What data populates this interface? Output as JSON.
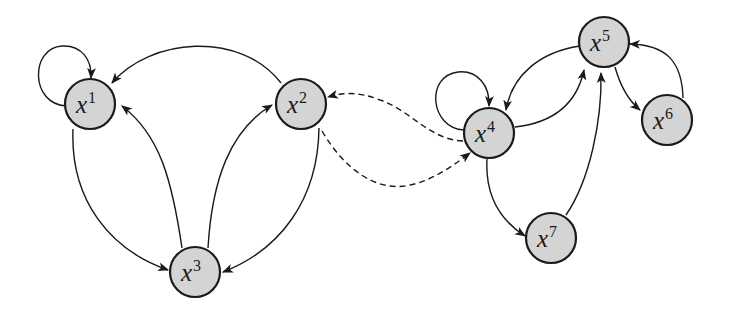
{
  "diagram": {
    "type": "directed-graph",
    "style": {
      "node_fill": "#d4d4d4",
      "node_stroke": "#1a1a1a",
      "edge_color": "#1a1a1a",
      "background": "#ffffff"
    },
    "nodes": [
      {
        "id": "x1",
        "base": "x",
        "sup": "1",
        "cx": 90,
        "cy": 104,
        "r": 25
      },
      {
        "id": "x2",
        "base": "x",
        "sup": "2",
        "cx": 301,
        "cy": 104,
        "r": 25
      },
      {
        "id": "x3",
        "base": "x",
        "sup": "3",
        "cx": 195,
        "cy": 272,
        "r": 25
      },
      {
        "id": "x4",
        "base": "x",
        "sup": "4",
        "cx": 489,
        "cy": 133,
        "r": 25
      },
      {
        "id": "x5",
        "base": "x",
        "sup": "5",
        "cx": 604,
        "cy": 42,
        "r": 25
      },
      {
        "id": "x6",
        "base": "x",
        "sup": "6",
        "cx": 667,
        "cy": 120,
        "r": 25
      },
      {
        "id": "x7",
        "base": "x",
        "sup": "7",
        "cx": 551,
        "cy": 238,
        "r": 25
      }
    ],
    "edges": [
      {
        "from": "x1",
        "to": "x1",
        "style": "solid",
        "kind": "self-loop"
      },
      {
        "from": "x2",
        "to": "x1",
        "style": "solid"
      },
      {
        "from": "x1",
        "to": "x3",
        "style": "solid"
      },
      {
        "from": "x3",
        "to": "x1",
        "style": "solid"
      },
      {
        "from": "x3",
        "to": "x2",
        "style": "solid"
      },
      {
        "from": "x2",
        "to": "x3",
        "style": "solid"
      },
      {
        "from": "x4",
        "to": "x2",
        "style": "dashed"
      },
      {
        "from": "x2",
        "to": "x4",
        "style": "dashed"
      },
      {
        "from": "x4",
        "to": "x4",
        "style": "solid",
        "kind": "self-loop"
      },
      {
        "from": "x5",
        "to": "x4",
        "style": "solid"
      },
      {
        "from": "x4",
        "to": "x5",
        "style": "solid"
      },
      {
        "from": "x4",
        "to": "x7",
        "style": "solid"
      },
      {
        "from": "x7",
        "to": "x5",
        "style": "solid"
      },
      {
        "from": "x5",
        "to": "x6",
        "style": "solid"
      },
      {
        "from": "x6",
        "to": "x5",
        "style": "solid"
      }
    ]
  },
  "labels": {
    "x1": {
      "base": "x",
      "sup": "1"
    },
    "x2": {
      "base": "x",
      "sup": "2"
    },
    "x3": {
      "base": "x",
      "sup": "3"
    },
    "x4": {
      "base": "x",
      "sup": "4"
    },
    "x5": {
      "base": "x",
      "sup": "5"
    },
    "x6": {
      "base": "x",
      "sup": "6"
    },
    "x7": {
      "base": "x",
      "sup": "7"
    }
  }
}
